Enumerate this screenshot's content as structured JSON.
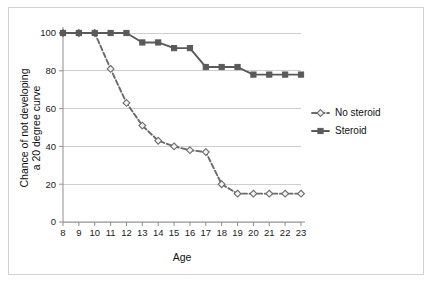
{
  "chart_data": {
    "type": "line",
    "title": "",
    "xlabel": "Age",
    "ylabel": "Chance of not developing\na 20 degree curve",
    "ylabel_line1": "Chance of not developing",
    "ylabel_line2": "a 20 degree curve",
    "x": [
      8,
      9,
      10,
      11,
      12,
      13,
      14,
      15,
      16,
      17,
      18,
      19,
      20,
      21,
      22,
      23
    ],
    "categories": [
      "8",
      "9",
      "10",
      "11",
      "12",
      "13",
      "14",
      "15",
      "16",
      "17",
      "18",
      "19",
      "20",
      "21",
      "22",
      "23"
    ],
    "xtick_labels": [
      "8",
      "9",
      "10",
      "11",
      "12",
      "13",
      "14",
      "15",
      "16",
      "17",
      "18",
      "19",
      "20",
      "21",
      "22",
      "23"
    ],
    "ytick_labels": [
      "0",
      "20",
      "40",
      "60",
      "80",
      "100"
    ],
    "yticks": [
      0,
      20,
      40,
      60,
      80,
      100
    ],
    "ylim": [
      0,
      100
    ],
    "xlim": [
      8,
      23
    ],
    "grid": "horizontal",
    "legend_position": "right",
    "series": [
      {
        "name": "No steroid",
        "values": [
          100,
          100,
          100,
          81,
          63,
          51,
          43,
          40,
          38,
          37,
          20,
          15,
          15,
          15,
          15,
          15
        ],
        "line_style": "dashed",
        "marker": "diamond",
        "color": "#6b6b6b",
        "marker_fill": "#f2f2f2"
      },
      {
        "name": "Steroid",
        "values": [
          100,
          100,
          100,
          100,
          100,
          95,
          95,
          92,
          92,
          82,
          82,
          82,
          78,
          78,
          78,
          78
        ],
        "line_style": "solid",
        "marker": "square",
        "color": "#5a5a5a",
        "marker_fill": "#5a5a5a"
      }
    ]
  },
  "legend": {
    "items": [
      {
        "label": "No steroid"
      },
      {
        "label": "Steroid"
      }
    ]
  },
  "axes": {
    "x_title": "Age",
    "y_title_line1": "Chance of not developing",
    "y_title_line2": "a 20 degree curve"
  },
  "colors": {
    "frame_border": "#d2d2d2",
    "grid": "#c9c9c9",
    "axis": "#8e8e8e",
    "series_no_steroid": "#6b6b6b",
    "series_steroid": "#5a5a5a",
    "text": "#101010",
    "background": "#ffffff"
  }
}
